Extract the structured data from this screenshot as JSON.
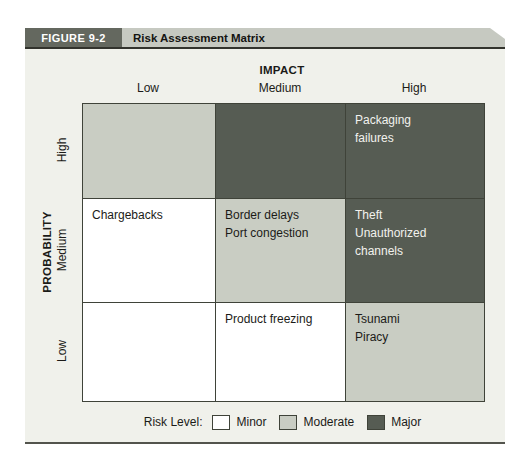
{
  "figure": {
    "label": "FIGURE 9-2",
    "title": "Risk Assessment Matrix"
  },
  "axes": {
    "impact_title": "IMPACT",
    "impact_labels": [
      "Low",
      "Medium",
      "High"
    ],
    "probability_title": "PROBABILITY",
    "probability_labels": [
      "High",
      "Medium",
      "Low"
    ]
  },
  "matrix": {
    "rows": [
      {
        "cells": [
          {
            "level": "moderate",
            "items": []
          },
          {
            "level": "major",
            "items": []
          },
          {
            "level": "major",
            "items": [
              "Packaging\nfailures"
            ]
          }
        ]
      },
      {
        "cells": [
          {
            "level": "minor",
            "items": [
              "Chargebacks"
            ]
          },
          {
            "level": "moderate",
            "items": [
              "Border delays",
              "Port congestion"
            ]
          },
          {
            "level": "major",
            "items": [
              "Theft",
              "Unauthorized\nchannels"
            ]
          }
        ]
      },
      {
        "cells": [
          {
            "level": "minor",
            "items": []
          },
          {
            "level": "minor",
            "items": [
              "Product freezing"
            ]
          },
          {
            "level": "moderate",
            "items": [
              "Tsunami",
              "Piracy"
            ]
          }
        ]
      }
    ]
  },
  "legend": {
    "label": "Risk Level:",
    "entries": [
      {
        "label": "Minor",
        "level": "minor"
      },
      {
        "label": "Moderate",
        "level": "moderate"
      },
      {
        "label": "Major",
        "level": "major"
      }
    ]
  },
  "colors": {
    "minor": "#ffffff",
    "moderate": "#c9cdc3",
    "major": "#565c53",
    "major_text": "#f2f2ee",
    "figure_label_bg": "#64685f",
    "titlebar_bg": "#c6c9c1",
    "body_bg": "#f0f1eb"
  }
}
